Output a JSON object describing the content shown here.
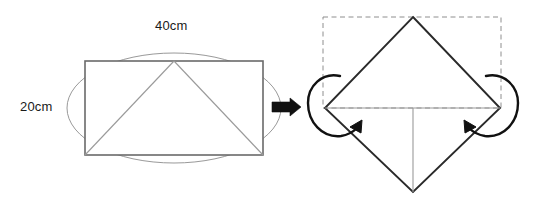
{
  "figure": {
    "background_color": "#ffffff",
    "stroke_color": "#555555",
    "dark_stroke_color": "#1a1a1a",
    "dashed_stroke_color": "#888888",
    "arrow_fill": "#111111"
  },
  "left_figure": {
    "name": "rectangle-with-inscribed-triangle",
    "labels": {
      "width": {
        "value": "40",
        "unit": "cm",
        "text": "40cm"
      },
      "height": {
        "value": "20",
        "unit": "cm",
        "text": "20cm"
      }
    },
    "shapes": {
      "rectangle": {
        "x": 85,
        "y": 61,
        "width": 178,
        "height": 94
      },
      "ellipse": {
        "cx": 174,
        "cy": 108,
        "rx": 107,
        "ry": 55
      },
      "triangle": {
        "apex_x": 174,
        "apex_y": 61,
        "left_x": 85,
        "left_y": 155,
        "right_x": 263,
        "right_y": 155
      }
    }
  },
  "transition": {
    "name": "process-arrow",
    "direction": "right",
    "x": 272,
    "y": 98,
    "width": 28,
    "height": 18
  },
  "right_figure": {
    "name": "folded-diamond",
    "shapes": {
      "dashed_rectangle": {
        "x": 323,
        "y": 17,
        "width": 178,
        "height": 91
      },
      "diamond": {
        "top_x": 413,
        "top_y": 17,
        "right_x": 500,
        "right_y": 108,
        "bottom_x": 413,
        "bottom_y": 192,
        "left_x": 325,
        "left_y": 108
      },
      "horizontal_fold_line": {
        "x1": 325,
        "y1": 108,
        "x2": 500,
        "y2": 108
      },
      "vertical_fold_line": {
        "x1": 413,
        "y1": 108,
        "x2": 413,
        "y2": 192
      }
    },
    "fold_arrows": [
      {
        "name": "left-fold-arrow",
        "side": "left",
        "rotation": "counterclockwise"
      },
      {
        "name": "right-fold-arrow",
        "side": "right",
        "rotation": "clockwise"
      }
    ]
  }
}
